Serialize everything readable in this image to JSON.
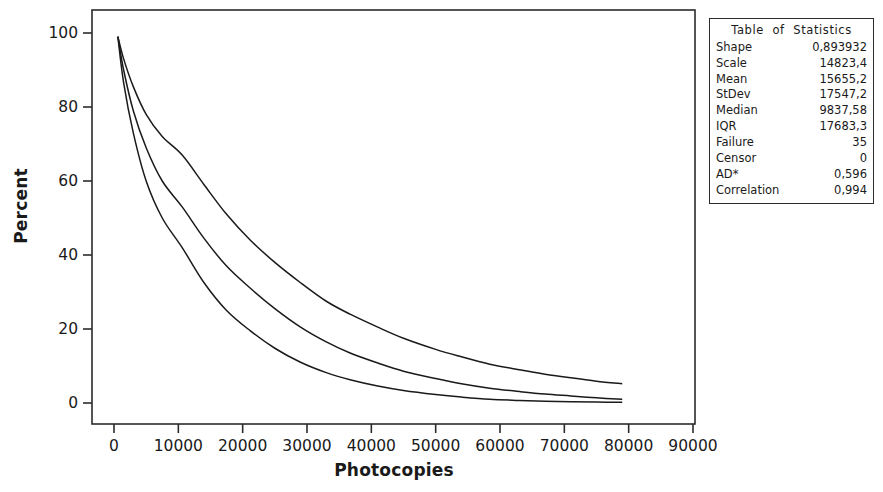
{
  "chart_data": {
    "type": "line",
    "title": "",
    "xlabel": "Photocopies",
    "ylabel": "Percent",
    "xlim": [
      0,
      90000
    ],
    "ylim": [
      0,
      100
    ],
    "xticks": [
      0,
      10000,
      20000,
      30000,
      40000,
      50000,
      60000,
      70000,
      80000,
      90000
    ],
    "xtick_labels": [
      "0",
      "10000",
      "20000",
      "30000",
      "40000",
      "50000",
      "60000",
      "70000",
      "80000",
      "90000"
    ],
    "yticks": [
      0,
      20,
      40,
      60,
      80,
      100
    ],
    "ytick_labels": [
      "0",
      "20",
      "40",
      "60",
      "80",
      "100"
    ],
    "grid": false,
    "legend": "none",
    "line_color": "#1a1a1a",
    "series": [
      {
        "name": "upper-confidence-bound",
        "x": [
          600,
          1500,
          3000,
          5000,
          7500,
          10600,
          14000,
          17500,
          21200,
          25000,
          29000,
          33000,
          36700,
          41000,
          45000,
          50000,
          54000,
          58400,
          63000,
          67000,
          71000,
          75000,
          79000
        ],
        "values": [
          99.0,
          93.0,
          85.5,
          78.0,
          72.0,
          67.0,
          59.0,
          51.0,
          44.0,
          38.0,
          32.5,
          27.5,
          24.0,
          20.5,
          17.5,
          14.5,
          12.5,
          10.5,
          9.0,
          7.8,
          6.8,
          5.9,
          5.2
        ]
      },
      {
        "name": "fitted-survival-curve",
        "x": [
          600,
          1500,
          3000,
          5000,
          7500,
          10600,
          14000,
          17500,
          21200,
          25000,
          29000,
          33000,
          36700,
          41000,
          45000,
          50000,
          54000,
          58400,
          63000,
          67000,
          71000,
          75000,
          79000
        ],
        "values": [
          99.0,
          90.0,
          79.0,
          69.0,
          60.0,
          53.0,
          44.5,
          37.0,
          31.0,
          25.5,
          20.5,
          16.5,
          13.5,
          10.8,
          8.6,
          6.6,
          5.2,
          4.0,
          3.1,
          2.4,
          1.9,
          1.4,
          1.0
        ]
      },
      {
        "name": "lower-confidence-bound",
        "x": [
          600,
          1500,
          3000,
          5000,
          7500,
          10600,
          14000,
          17500,
          21200,
          25000,
          29000,
          33000,
          36700,
          41000,
          45000,
          50000,
          54000,
          58400,
          63000,
          67000,
          71000,
          75000,
          79000
        ],
        "values": [
          99.0,
          86.5,
          73.0,
          60.0,
          50.0,
          42.0,
          32.5,
          25.0,
          19.5,
          14.8,
          11.0,
          8.2,
          6.3,
          4.6,
          3.4,
          2.3,
          1.6,
          1.0,
          0.7,
          0.5,
          0.35,
          0.25,
          0.2
        ]
      }
    ]
  },
  "stats_table": {
    "title": "Table  of  Statistics",
    "rows": [
      {
        "label": "Shape",
        "value": "0,893932"
      },
      {
        "label": "Scale",
        "value": "14823,4"
      },
      {
        "label": "Mean",
        "value": "15655,2"
      },
      {
        "label": "StDev",
        "value": "17547,2"
      },
      {
        "label": "Median",
        "value": "9837,58"
      },
      {
        "label": "IQR",
        "value": "17683,3"
      },
      {
        "label": "Failure",
        "value": "35"
      },
      {
        "label": "Censor",
        "value": "0"
      },
      {
        "label": "AD*",
        "value": "0,596"
      },
      {
        "label": "Correlation",
        "value": "0,994"
      }
    ]
  }
}
